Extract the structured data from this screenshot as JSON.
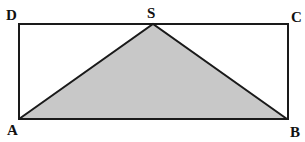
{
  "diagram": {
    "type": "geometry",
    "colors": {
      "stroke": "#1a1a1a",
      "triangle_fill": "#c8c8c8",
      "background": "#ffffff"
    },
    "points": {
      "A": {
        "label": "A",
        "x": 19,
        "y": 119
      },
      "B": {
        "label": "B",
        "x": 287,
        "y": 119
      },
      "C": {
        "label": "C",
        "x": 289,
        "y": 24
      },
      "D": {
        "label": "D",
        "x": 19,
        "y": 24
      },
      "S": {
        "label": "S",
        "x": 153,
        "y": 24
      }
    },
    "shapes": [
      {
        "name": "rectangle",
        "vertices": [
          "A",
          "B",
          "C",
          "D"
        ]
      },
      {
        "name": "triangle",
        "vertices": [
          "A",
          "S",
          "B"
        ],
        "shaded": true
      }
    ]
  }
}
